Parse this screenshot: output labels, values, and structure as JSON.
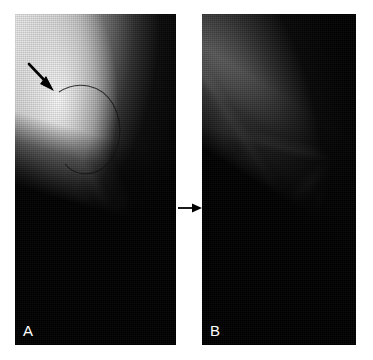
{
  "figure": {
    "type": "medical-image-figure",
    "modality": "mammogram",
    "background_color": "#ffffff",
    "panel_count": 2,
    "connector": {
      "icon": "right-arrow-icon",
      "direction": "right",
      "color": "#000000",
      "position": {
        "x": 176,
        "y": 194,
        "width": 28,
        "height": 28
      }
    }
  },
  "panels": [
    {
      "id": "panel-a",
      "label": "A",
      "label_color": "#ffffff",
      "position": {
        "x": 15,
        "y": 14,
        "width": 161,
        "height": 331
      },
      "description": "Mammogram with bright dense tissue upper-left and dark background to the right",
      "annotations": [
        {
          "type": "arrow",
          "icon": "pointer-arrow-icon",
          "color": "#000000",
          "points_to": "bright nodular density at skin line",
          "tail": {
            "x": 30,
            "y": 64
          },
          "tip": {
            "x": 53,
            "y": 89
          }
        },
        {
          "type": "circle-outline",
          "icon": "circle-marker-icon",
          "color": "#111111",
          "center": {
            "x": 86,
            "y": 112
          },
          "radius_x": 30,
          "radius_y": 42
        }
      ]
    },
    {
      "id": "panel-b",
      "label": "B",
      "label_color": "#ffffff",
      "position": {
        "x": 202,
        "y": 14,
        "width": 154,
        "height": 331
      },
      "description": "Follow-up mammogram showing fibroglandular tissue without the focal density",
      "annotations": []
    }
  ],
  "colors": {
    "background": "#ffffff",
    "image_black": "#000000",
    "tissue_bright": "#f2f2f2",
    "tissue_mid": "#8c8c8c",
    "annotation": "#000000",
    "label": "#ffffff"
  }
}
